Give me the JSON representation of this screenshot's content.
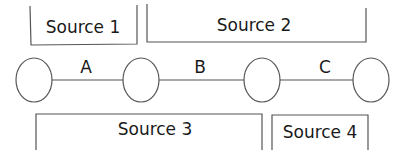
{
  "diagram": {
    "type": "linear-chain",
    "nodes": [
      {
        "id": "n1"
      },
      {
        "id": "n2"
      },
      {
        "id": "n3"
      },
      {
        "id": "n4"
      }
    ],
    "edges": [
      {
        "from": "n1",
        "to": "n2",
        "label": "A"
      },
      {
        "from": "n2",
        "to": "n3",
        "label": "B"
      },
      {
        "from": "n3",
        "to": "n4",
        "label": "C"
      }
    ],
    "sources": [
      {
        "label": "Source 1",
        "position": "top"
      },
      {
        "label": "Source 2",
        "position": "top"
      },
      {
        "label": "Source 3",
        "position": "bottom"
      },
      {
        "label": "Source 4",
        "position": "bottom"
      }
    ]
  },
  "colors": {
    "stroke": "#555555",
    "text": "#1a1a1a",
    "background": "#ffffff"
  }
}
